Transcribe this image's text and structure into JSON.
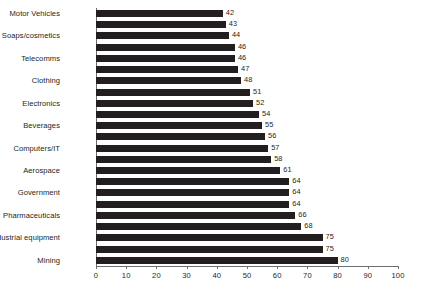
{
  "chart_data": {
    "type": "bar",
    "orientation": "horizontal",
    "title": "",
    "subtitle": "",
    "xlabel": "",
    "ylabel": "",
    "xlim": [
      0,
      100
    ],
    "xticks": [
      0,
      10,
      20,
      30,
      40,
      50,
      60,
      70,
      80,
      90,
      100
    ],
    "xtick_labels": [
      "0",
      "10",
      "20",
      "30",
      "40",
      "50",
      "60",
      "70",
      "80",
      "90",
      "100"
    ],
    "grid": false,
    "legend": false,
    "bar_color": "#231f20",
    "axis_color": "#6d6e71",
    "background": "#ffffff",
    "show_data_labels": true,
    "label_every_n_bars": 2,
    "categories": [
      "Motor Vehicles",
      "",
      "Soaps/cosmetics",
      "",
      "Telecomms",
      "",
      "Clothing",
      "",
      "Electronics",
      "",
      "Beverages",
      "",
      "Computers/IT",
      "",
      "Aerospace",
      "",
      "Government",
      "",
      "Pharmaceuticals",
      "",
      "Farm/Industrial equipment",
      "",
      "Mining"
    ],
    "values": [
      42,
      43,
      44,
      46,
      46,
      47,
      48,
      51,
      52,
      54,
      55,
      56,
      57,
      58,
      61,
      64,
      64,
      64,
      66,
      68,
      75,
      75,
      80
    ],
    "value_labels": [
      "42",
      "43",
      "44",
      "46",
      "46",
      "47",
      "48",
      "51",
      "52",
      "54",
      "55",
      "56",
      "57",
      "58",
      "61",
      "64",
      "64",
      "64",
      "66",
      "68",
      "75",
      "75",
      "80"
    ],
    "labeled_categories": [
      "Motor Vehicles",
      "Soaps/cosmetics",
      "Telecomms",
      "Clothing",
      "Electronics",
      "Beverages",
      "Computers/IT",
      "Aerospace",
      "Government",
      "Pharmaceuticals",
      "Farm/Industrial equipment",
      "Mining"
    ]
  }
}
